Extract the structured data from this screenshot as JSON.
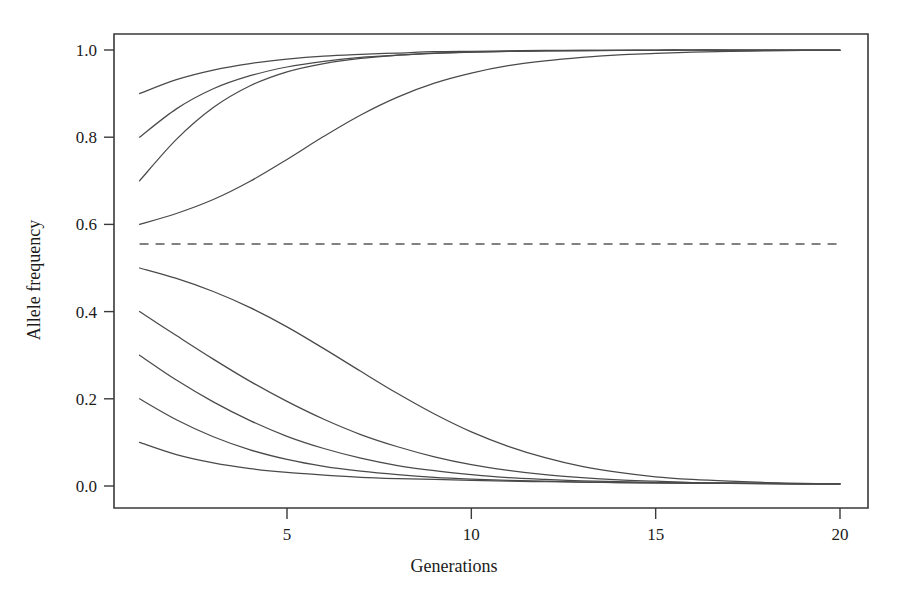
{
  "chart_data": {
    "type": "line",
    "title": "",
    "subtitle": "",
    "xlabel": "Generations",
    "ylabel": "Allele frequency",
    "xlim": [
      1,
      20
    ],
    "ylim": [
      0.0,
      1.0
    ],
    "grid": false,
    "legend": "none",
    "x_ticks": [
      5,
      10,
      15,
      20
    ],
    "x_tick_labels": [
      "5",
      "10",
      "15",
      "20"
    ],
    "y_ticks": [
      0.0,
      0.2,
      0.4,
      0.6,
      0.8,
      1.0
    ],
    "y_tick_labels": [
      "0.0",
      "0.2",
      "0.4",
      "0.6",
      "0.8",
      "1.0"
    ],
    "x": [
      1,
      2,
      3,
      4,
      5,
      6,
      7,
      8,
      9,
      10,
      11,
      12,
      13,
      14,
      15,
      16,
      17,
      18,
      19,
      20
    ],
    "annotations": [
      {
        "name": "equilibrium-dashed-line",
        "kind": "horizontal-dashed-line",
        "y": 0.555,
        "x_start": 1,
        "x_end": 20,
        "label": ""
      }
    ],
    "series": [
      {
        "name": "p0 = 0.9",
        "start": 0.9,
        "style": "solid",
        "values": [
          0.9,
          0.932,
          0.954,
          0.969,
          0.979,
          0.986,
          0.99,
          0.993,
          0.996,
          0.997,
          0.998,
          0.999,
          0.999,
          0.999,
          1.0,
          1.0,
          1.0,
          1.0,
          1.0,
          1.0
        ]
      },
      {
        "name": "p0 = 0.8",
        "start": 0.8,
        "style": "solid",
        "values": [
          0.8,
          0.865,
          0.911,
          0.941,
          0.961,
          0.974,
          0.983,
          0.988,
          0.992,
          0.995,
          0.997,
          0.998,
          0.998,
          0.999,
          0.999,
          1.0,
          1.0,
          1.0,
          1.0,
          1.0
        ]
      },
      {
        "name": "p0 = 0.7",
        "start": 0.7,
        "style": "solid",
        "values": [
          0.7,
          0.795,
          0.868,
          0.918,
          0.95,
          0.969,
          0.981,
          0.988,
          0.993,
          0.995,
          0.997,
          0.998,
          0.999,
          0.999,
          0.999,
          1.0,
          1.0,
          1.0,
          1.0,
          1.0
        ]
      },
      {
        "name": "p0 = 0.6",
        "start": 0.6,
        "style": "solid",
        "values": [
          0.6,
          0.625,
          0.657,
          0.699,
          0.749,
          0.802,
          0.851,
          0.892,
          0.924,
          0.947,
          0.964,
          0.975,
          0.983,
          0.989,
          0.992,
          0.995,
          0.997,
          0.998,
          0.999,
          0.999
        ]
      },
      {
        "name": "p0 = 0.5",
        "start": 0.5,
        "style": "solid",
        "values": [
          0.5,
          0.476,
          0.446,
          0.409,
          0.365,
          0.315,
          0.263,
          0.212,
          0.165,
          0.124,
          0.091,
          0.065,
          0.045,
          0.031,
          0.021,
          0.015,
          0.011,
          0.008,
          0.006,
          0.005
        ]
      },
      {
        "name": "p0 = 0.4",
        "start": 0.4,
        "style": "solid",
        "values": [
          0.4,
          0.345,
          0.291,
          0.24,
          0.194,
          0.153,
          0.118,
          0.09,
          0.067,
          0.049,
          0.036,
          0.026,
          0.019,
          0.014,
          0.011,
          0.008,
          0.007,
          0.006,
          0.005,
          0.005
        ]
      },
      {
        "name": "p0 = 0.3",
        "start": 0.3,
        "style": "solid",
        "values": [
          0.3,
          0.243,
          0.193,
          0.15,
          0.114,
          0.086,
          0.064,
          0.047,
          0.035,
          0.026,
          0.019,
          0.015,
          0.012,
          0.01,
          0.008,
          0.007,
          0.006,
          0.006,
          0.005,
          0.005
        ]
      },
      {
        "name": "p0 = 0.2",
        "start": 0.2,
        "style": "solid",
        "values": [
          0.2,
          0.152,
          0.113,
          0.083,
          0.061,
          0.045,
          0.034,
          0.026,
          0.02,
          0.016,
          0.013,
          0.011,
          0.009,
          0.008,
          0.007,
          0.006,
          0.006,
          0.005,
          0.005,
          0.005
        ]
      },
      {
        "name": "p0 = 0.1",
        "start": 0.1,
        "style": "solid",
        "values": [
          0.1,
          0.072,
          0.053,
          0.04,
          0.031,
          0.025,
          0.02,
          0.017,
          0.015,
          0.013,
          0.011,
          0.01,
          0.009,
          0.008,
          0.007,
          0.007,
          0.006,
          0.006,
          0.005,
          0.005
        ]
      }
    ],
    "colors": {
      "curve": "#4a4a4a",
      "axis": "#3a3a3a",
      "dashed": "#5a5a5a",
      "background": "#ffffff",
      "text": "#1b1b1b"
    }
  }
}
